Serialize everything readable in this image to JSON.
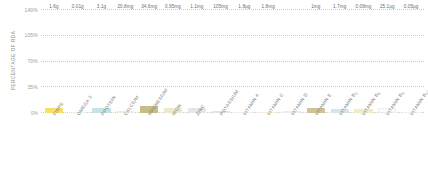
{
  "chart_data": {
    "type": "bar",
    "title": "",
    "subtitle": "",
    "xlabel": "",
    "ylabel": "PERCENTAGE OF RDA",
    "ylim": [
      0,
      140
    ],
    "yticks": [
      0,
      35,
      70,
      105,
      140
    ],
    "ytick_labels": [
      "0%",
      "35%",
      "70%",
      "105%",
      "140%"
    ],
    "grid": true,
    "grid_style": "dotted-horizontal",
    "legend": "none",
    "categories": [
      "FIBRE",
      "OMEGA 3",
      "PROTEIN",
      "CALCIUM",
      "MAGNESIUM",
      "IRON",
      "ZINC",
      "POTASSIUM",
      "VITAMIN A",
      "VITAMIN C",
      "VITAMIN D",
      "VITAMIN E",
      "VITAMIN B3",
      "VITAMIN B6",
      "VITAMIN B9",
      "VITAMIN B12"
    ],
    "data_labels": [
      "1.6g",
      "0.01g",
      "3.1g",
      "20.8mg",
      "34.6mg",
      "0.95mg",
      "1.1mg",
      "105mg",
      "1.8µg",
      "1.8mg",
      "",
      "1mg",
      "1.7mg",
      "0.08mg",
      "25.1µg",
      "0.05µg"
    ],
    "values": [
      6.4,
      1.0,
      6.2,
      2.6,
      9.2,
      6.8,
      7.3,
      3.0,
      0.2,
      2.0,
      0.0,
      6.7,
      5.2,
      5.7,
      6.3,
      2.0
    ],
    "bar_colors": [
      "#f5e06a",
      "#f2efe0",
      "#c6e4e6",
      "#efece2",
      "#c4bd86",
      "#efe8c8",
      "#e6e6e6",
      "#dfe7e6",
      "#f0f0ec",
      "#f4efd2",
      "#ffffff",
      "#cfc398",
      "#d7e4ee",
      "#f2ecc4",
      "#fbfbf7",
      "#f0f0ec"
    ]
  },
  "bars": [
    {
      "category": "FIBRE",
      "label": "1.6g",
      "value": 6.4,
      "color": "#f5e06a",
      "sub": ""
    },
    {
      "category": "OMEGA 3",
      "label": "0.01g",
      "value": 1.0,
      "color": "#f2efe0",
      "sub": ""
    },
    {
      "category": "PROTEIN",
      "label": "3.1g",
      "value": 6.2,
      "color": "#c6e4e6",
      "sub": ""
    },
    {
      "category": "CALCIUM",
      "label": "20.8mg",
      "value": 2.6,
      "color": "#efece2",
      "sub": ""
    },
    {
      "category": "MAGNESIUM",
      "label": "34.6mg",
      "value": 9.2,
      "color": "#c4bd86",
      "sub": ""
    },
    {
      "category": "IRON",
      "label": "0.95mg",
      "value": 6.8,
      "color": "#efe8c8",
      "sub": ""
    },
    {
      "category": "ZINC",
      "label": "1.1mg",
      "value": 7.3,
      "color": "#e6e6e6",
      "sub": ""
    },
    {
      "category": "POTASSIUM",
      "label": "105mg",
      "value": 3.0,
      "color": "#dfe7e6",
      "sub": ""
    },
    {
      "category": "VITAMIN A",
      "label": "1.8µg",
      "value": 0.2,
      "color": "#f0f0ec",
      "sub": ""
    },
    {
      "category": "VITAMIN C",
      "label": "1.8mg",
      "value": 2.0,
      "color": "#f4efd2",
      "sub": ""
    },
    {
      "category": "VITAMIN D",
      "label": "",
      "value": 0.0,
      "color": "#ffffff",
      "sub": ""
    },
    {
      "category": "VITAMIN E",
      "label": "1mg",
      "value": 6.7,
      "color": "#cfc398",
      "sub": ""
    },
    {
      "category": "VITAMIN B",
      "label": "1.7mg",
      "value": 5.2,
      "color": "#d7e4ee",
      "sub": "3"
    },
    {
      "category": "VITAMIN B",
      "label": "0.08mg",
      "value": 5.7,
      "color": "#f2ecc4",
      "sub": "6"
    },
    {
      "category": "VITAMIN B",
      "label": "25.1µg",
      "value": 6.3,
      "color": "#fbfbf7",
      "sub": "9"
    },
    {
      "category": "VITAMIN B",
      "label": "0.05µg",
      "value": 2.0,
      "color": "#f0f0ec",
      "sub": "12"
    }
  ],
  "axis": {
    "y_title": "PERCENTAGE OF RDA",
    "y_ticks": [
      {
        "label": "140%",
        "value": 140
      },
      {
        "label": "105%",
        "value": 105
      },
      {
        "label": "70%",
        "value": 70
      },
      {
        "label": "35%",
        "value": 35
      },
      {
        "label": "0%",
        "value": 0
      }
    ]
  },
  "colors": {
    "grid": "#c9c9c9",
    "tick_text": "#9a9a9a",
    "label_text": "#7e7e7e",
    "value_text": "#6a6a6a",
    "background": "#ffffff"
  }
}
